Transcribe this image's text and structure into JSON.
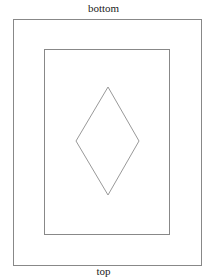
{
  "labels": {
    "top_label": "bottom",
    "bottom_label": "top"
  },
  "shapes": {
    "outer_rect": {
      "x": 13,
      "y": 19,
      "w": 188,
      "h": 246
    },
    "inner_rect": {
      "x": 44,
      "y": 49,
      "w": 125,
      "h": 185
    },
    "diamond": {
      "points": "108,87 139,141 108,195 76,141"
    }
  },
  "colors": {
    "stroke": "#888888",
    "text": "#222222"
  }
}
